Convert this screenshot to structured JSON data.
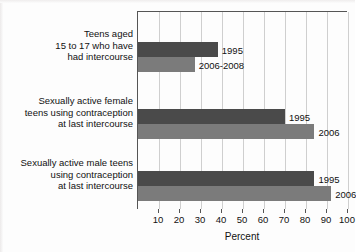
{
  "chart_data": {
    "type": "bar",
    "orientation": "horizontal",
    "title": "",
    "xlabel": "Percent",
    "ylabel": "",
    "xlim": [
      0,
      100
    ],
    "xticks": [
      10,
      20,
      30,
      40,
      50,
      60,
      70,
      80,
      90,
      100
    ],
    "xticklabels": [
      "10",
      "20",
      "30",
      "40",
      "50",
      "60",
      "70",
      "80",
      "90",
      "100"
    ],
    "grid": "vertical",
    "legend": "inline-bar-labels",
    "categories": [
      "Teens aged 15 to 17 who have had intercourse",
      "Sexually active female teens using contraception at last intercourse",
      "Sexually active male teens using contraception at last intercourse"
    ],
    "category_label_lines": [
      [
        "Teens aged",
        "15 to 17 who have",
        "had intercourse"
      ],
      [
        "Sexually active female",
        "teens using contraception",
        "at last intercourse"
      ],
      [
        "Sexually active male teens",
        "using contraception",
        "at last intercourse"
      ]
    ],
    "series": [
      {
        "name": "1995",
        "color": "#4a4a4a",
        "values": [
          38,
          70,
          84
        ],
        "point_labels": [
          "1995",
          "1995",
          "1995"
        ]
      },
      {
        "name": "2006-2008 / 2006",
        "color": "#7b7b7b",
        "values": [
          27,
          84,
          92
        ],
        "point_labels": [
          "2006-2008",
          "2006",
          "2006"
        ]
      }
    ]
  },
  "axis": {
    "xlabel": "Percent"
  },
  "colors": {
    "series_1995": "#4a4a4a",
    "series_2006": "#7b7b7b",
    "gridline": "#cfcfcf",
    "axis": "#555555",
    "background": "#fdfdfd",
    "text": "#111111"
  }
}
